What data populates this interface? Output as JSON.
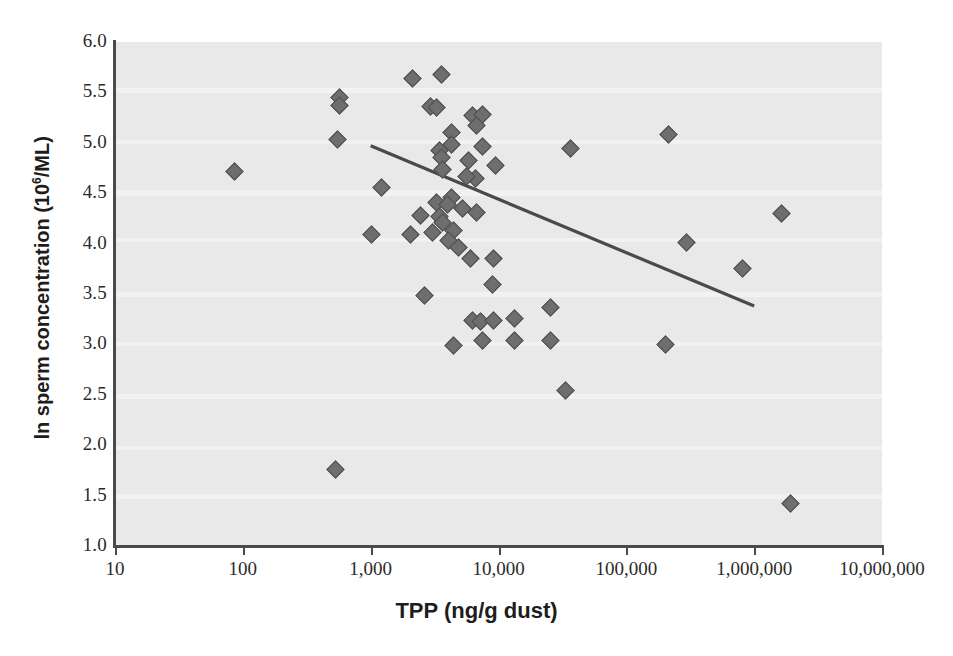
{
  "chart_data": {
    "type": "scatter",
    "title": "",
    "xlabel": "TPP (ng/g dust)",
    "ylabel": "ln sperm concentration (10⁶/ML)",
    "ylabel_parts": {
      "prefix": "ln sperm concentration (10",
      "sup": "6",
      "suffix": "/ML)"
    },
    "xscale": "log",
    "yscale": "linear",
    "xlim": [
      10,
      10000000
    ],
    "ylim": [
      1.0,
      6.0
    ],
    "grid": false,
    "legend": null,
    "background_color": "#e9e9e9",
    "marker_color": "#6e6e6e",
    "marker_shape": "diamond",
    "line_color": "#4a4a4a",
    "xticks": [
      10,
      100,
      1000,
      10000,
      100000,
      1000000,
      10000000
    ],
    "xtick_labels": [
      "10",
      "100",
      "1,000",
      "10,000",
      "100,000",
      "1,000,000",
      "10,000,000"
    ],
    "yticks": [
      1.0,
      1.5,
      2.0,
      2.5,
      3.0,
      3.5,
      4.0,
      4.5,
      5.0,
      5.5,
      6.0
    ],
    "ytick_labels": [
      "1.0",
      "1.5",
      "2.0",
      "2.5",
      "3.0",
      "3.5",
      "4.0",
      "4.5",
      "5.0",
      "5.5",
      "6.0"
    ],
    "n_points": 57,
    "points": [
      {
        "x": 85,
        "y": 4.73
      },
      {
        "x": 560,
        "y": 5.46
      },
      {
        "x": 560,
        "y": 5.38
      },
      {
        "x": 540,
        "y": 5.04
      },
      {
        "x": 1000,
        "y": 4.1
      },
      {
        "x": 520,
        "y": 1.77
      },
      {
        "x": 2100,
        "y": 5.65
      },
      {
        "x": 3500,
        "y": 5.69
      },
      {
        "x": 2900,
        "y": 5.37
      },
      {
        "x": 3200,
        "y": 5.36
      },
      {
        "x": 6100,
        "y": 5.28
      },
      {
        "x": 7400,
        "y": 5.29
      },
      {
        "x": 4200,
        "y": 5.11
      },
      {
        "x": 6600,
        "y": 5.18
      },
      {
        "x": 3400,
        "y": 4.93
      },
      {
        "x": 4200,
        "y": 4.99
      },
      {
        "x": 7400,
        "y": 4.97
      },
      {
        "x": 3500,
        "y": 4.86
      },
      {
        "x": 5700,
        "y": 4.83
      },
      {
        "x": 6500,
        "y": 4.66
      },
      {
        "x": 3600,
        "y": 4.75
      },
      {
        "x": 9300,
        "y": 4.78
      },
      {
        "x": 5500,
        "y": 4.68
      },
      {
        "x": 1200,
        "y": 4.57
      },
      {
        "x": 3200,
        "y": 4.42
      },
      {
        "x": 4200,
        "y": 4.47
      },
      {
        "x": 3900,
        "y": 4.4
      },
      {
        "x": 5100,
        "y": 4.36
      },
      {
        "x": 6600,
        "y": 4.32
      },
      {
        "x": 2400,
        "y": 4.29
      },
      {
        "x": 3400,
        "y": 4.28
      },
      {
        "x": 3600,
        "y": 4.22
      },
      {
        "x": 3000,
        "y": 4.12
      },
      {
        "x": 4400,
        "y": 4.14
      },
      {
        "x": 2000,
        "y": 4.1
      },
      {
        "x": 4000,
        "y": 4.04
      },
      {
        "x": 4800,
        "y": 3.97
      },
      {
        "x": 5900,
        "y": 3.86
      },
      {
        "x": 9000,
        "y": 3.86
      },
      {
        "x": 8800,
        "y": 3.6
      },
      {
        "x": 2600,
        "y": 3.5
      },
      {
        "x": 6200,
        "y": 3.25
      },
      {
        "x": 7100,
        "y": 3.24
      },
      {
        "x": 9000,
        "y": 3.25
      },
      {
        "x": 13000,
        "y": 3.27
      },
      {
        "x": 7300,
        "y": 3.05
      },
      {
        "x": 4400,
        "y": 3.0
      },
      {
        "x": 13000,
        "y": 3.05
      },
      {
        "x": 25000,
        "y": 3.38
      },
      {
        "x": 25000,
        "y": 3.05
      },
      {
        "x": 33000,
        "y": 2.55
      },
      {
        "x": 36000,
        "y": 4.95
      },
      {
        "x": 210000,
        "y": 5.09
      },
      {
        "x": 200000,
        "y": 3.01
      },
      {
        "x": 290000,
        "y": 4.02
      },
      {
        "x": 800000,
        "y": 3.76
      },
      {
        "x": 1600000,
        "y": 4.31
      },
      {
        "x": 1900000,
        "y": 1.43
      }
    ],
    "trendline": {
      "type": "linear-fit",
      "direction": "negative",
      "x_start": 1000,
      "y_start": 4.97,
      "x_end": 1000000,
      "y_end": 3.38
    }
  }
}
